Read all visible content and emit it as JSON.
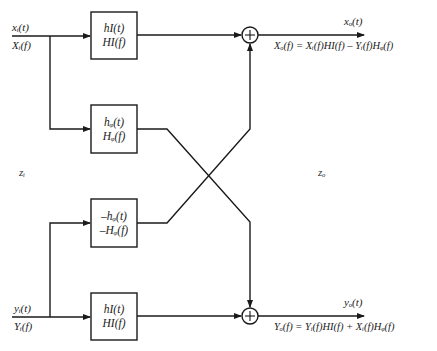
{
  "diagram": {
    "type": "complex-filter-block-diagram",
    "inputs": {
      "top": {
        "time": "xᵢ(t)",
        "freq": "Xᵢ(f)"
      },
      "bottom": {
        "time": "yᵢ(t)",
        "freq": "Yᵢ(f)"
      }
    },
    "blocks": [
      {
        "id": "hI-top",
        "line1": "h_I(t)",
        "line2": "H_I(f)",
        "line1_display": "hΙ(t)",
        "line2_display": "HΙ(f)"
      },
      {
        "id": "hQ",
        "line1": "h_Q(t)",
        "line2": "H_Q(f)",
        "line1_display": "hᵩ(t)",
        "line2_display": "Hᵩ(f)"
      },
      {
        "id": "neg-hQ",
        "line1": "-h_Q(t)",
        "line2": "-H_Q(f)",
        "line1_display": "–hᵩ(t)",
        "line2_display": "–Hᵩ(f)"
      },
      {
        "id": "hI-bottom",
        "line1": "h_I(t)",
        "line2": "H_I(f)",
        "line1_display": "hΙ(t)",
        "line2_display": "HΙ(f)"
      }
    ],
    "summers": [
      {
        "id": "top-summer",
        "symbol": "+"
      },
      {
        "id": "bottom-summer",
        "symbol": "+"
      }
    ],
    "outputs": {
      "top": {
        "time": "xₒ(t)",
        "equation": "Xₒ(f) = Xᵢ(f)HΙ(f) – Yᵢ(f)Hᵩ(f)"
      },
      "bottom": {
        "time": "yₒ(t)",
        "equation": "Yₒ(f) = Yᵢ(f)HΙ(f) + Xᵢ(f)Hᵩ(f)"
      }
    },
    "side_labels": {
      "input": "zᵢ",
      "output": "zₒ"
    },
    "colors": {
      "line": "#1a1a1a",
      "background": "#ffffff"
    }
  }
}
